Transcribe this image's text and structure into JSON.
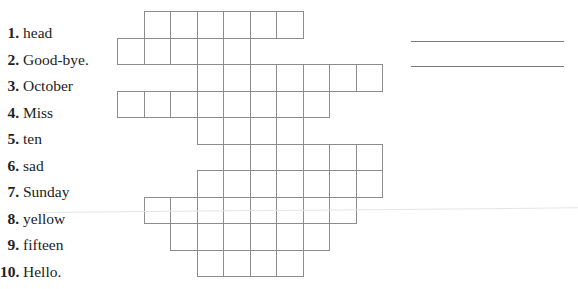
{
  "exercise": {
    "clues": [
      {
        "number": "1.",
        "word": "head",
        "start_col": 1,
        "length": 6
      },
      {
        "number": "2.",
        "word": "Good-bye.",
        "start_col": 0,
        "length": 5
      },
      {
        "number": "3.",
        "word": "October",
        "start_col": 3,
        "length": 7
      },
      {
        "number": "4.",
        "word": "Miss",
        "start_col": 0,
        "length": 8
      },
      {
        "number": "5.",
        "word": "ten",
        "start_col": 3,
        "length": 4
      },
      {
        "number": "6.",
        "word": "sad",
        "start_col": 4,
        "length": 6
      },
      {
        "number": "7.",
        "word": "Sunday",
        "start_col": 3,
        "length": 7
      },
      {
        "number": "8.",
        "word": "yellow",
        "start_col": 1,
        "length": 8
      },
      {
        "number": "9.",
        "word": "fifteen",
        "start_col": 2,
        "length": 6
      },
      {
        "number": "10.",
        "word": "Hello.",
        "start_col": 3,
        "length": 4
      }
    ],
    "grid": {
      "origin_x": 117,
      "origin_y": 11,
      "cell_size": 26.5,
      "line_color": "#8c8c8c"
    },
    "answer_lines": [
      {
        "y": 41
      },
      {
        "y": 66
      }
    ]
  }
}
